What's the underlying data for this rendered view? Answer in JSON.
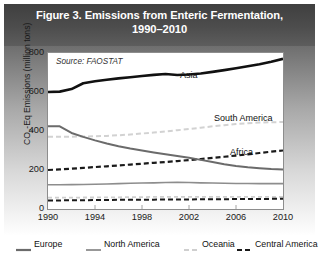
{
  "figure": {
    "title_line1": "Figure 3. Emissions from Enteric Fermentation,",
    "title_line2": "1990–2010",
    "source_note": "Source: FAOSTAT"
  },
  "axis": {
    "y_title_prefix": "CO",
    "y_title_sub": "2",
    "y_title_suffix": "-Eq Emissions (million tons)",
    "y_ticks": [
      "800",
      "600",
      "400",
      "200",
      "0"
    ],
    "x_ticks": [
      "1990",
      "1994",
      "1998",
      "2002",
      "2006",
      "2010"
    ]
  },
  "series_labels": {
    "asia": "Asia",
    "south_america": "South America",
    "africa": "Africa"
  },
  "legend": {
    "items": [
      {
        "label": "Europe",
        "color": "#6b6b6b",
        "style": "solid",
        "width": 2.2
      },
      {
        "label": "North America",
        "color": "#8d8d8d",
        "style": "solid",
        "width": 1.8
      },
      {
        "label": "Oceania",
        "color": "#cfcfcf",
        "style": "dashed",
        "width": 1.8
      },
      {
        "label": "Central America",
        "color": "#1a1a1a",
        "style": "dashed",
        "width": 2.0
      }
    ]
  },
  "colors": {
    "header_band": "#4d4d4d",
    "plot_border": "#8d8d8d",
    "asia": "#111111",
    "south_america": "#d2d2d2",
    "africa": "#1a1a1a",
    "europe": "#6b6b6b",
    "north_america": "#8d8d8d",
    "oceania": "#cfcfcf",
    "central_america": "#1a1a1a"
  },
  "chart_data": {
    "type": "line",
    "title": "Figure 3. Emissions from Enteric Fermentation, 1990–2010",
    "xlabel": "",
    "ylabel": "CO2-Eq Emissions (million tons)",
    "xlim": [
      1990,
      2010
    ],
    "ylim": [
      0,
      800
    ],
    "y_ticks": [
      0,
      200,
      400,
      600,
      800
    ],
    "x_ticks": [
      1990,
      1994,
      1998,
      2002,
      2006,
      2010
    ],
    "grid": false,
    "legend_position": "below-plot",
    "source": "FAOSTAT",
    "x": [
      1990,
      1991,
      1992,
      1993,
      1994,
      1995,
      1996,
      1997,
      1998,
      1999,
      2000,
      2001,
      2002,
      2003,
      2004,
      2005,
      2006,
      2007,
      2008,
      2009,
      2010
    ],
    "series": [
      {
        "name": "Asia",
        "color": "#111111",
        "style": "solid",
        "labeled_on_plot": true,
        "values": [
          600,
          602,
          615,
          645,
          655,
          663,
          670,
          676,
          682,
          688,
          692,
          687,
          690,
          695,
          703,
          712,
          722,
          732,
          742,
          755,
          770
        ]
      },
      {
        "name": "South America",
        "color": "#d2d2d2",
        "style": "dashed",
        "labeled_on_plot": true,
        "values": [
          370,
          370,
          371,
          372,
          373,
          375,
          378,
          382,
          387,
          392,
          398,
          404,
          410,
          417,
          424,
          430,
          436,
          440,
          443,
          445,
          446
        ]
      },
      {
        "name": "Africa",
        "color": "#1a1a1a",
        "style": "dashed",
        "labeled_on_plot": true,
        "values": [
          200,
          203,
          207,
          211,
          215,
          219,
          223,
          228,
          232,
          237,
          241,
          246,
          251,
          256,
          262,
          268,
          274,
          280,
          287,
          294,
          300
        ]
      },
      {
        "name": "Europe",
        "color": "#6b6b6b",
        "style": "solid",
        "labeled_on_plot": false,
        "values": [
          425,
          424,
          390,
          370,
          352,
          336,
          322,
          310,
          300,
          290,
          281,
          272,
          263,
          252,
          241,
          230,
          221,
          214,
          209,
          205,
          203
        ]
      },
      {
        "name": "North America",
        "color": "#8d8d8d",
        "style": "solid",
        "labeled_on_plot": false,
        "values": [
          124,
          124,
          125,
          126,
          127,
          128,
          130,
          132,
          133,
          134,
          136,
          137,
          136,
          134,
          133,
          132,
          131,
          131,
          130,
          130,
          130
        ]
      },
      {
        "name": "Oceania",
        "color": "#cfcfcf",
        "style": "dashed",
        "labeled_on_plot": false,
        "values": [
          58,
          58,
          58,
          59,
          59,
          60,
          60,
          61,
          61,
          62,
          62,
          62,
          62,
          62,
          62,
          62,
          62,
          62,
          62,
          62,
          62
        ]
      },
      {
        "name": "Central America",
        "color": "#1a1a1a",
        "style": "dashed",
        "labeled_on_plot": false,
        "values": [
          44,
          44,
          45,
          45,
          46,
          46,
          47,
          47,
          48,
          48,
          49,
          49,
          49,
          50,
          50,
          50,
          51,
          51,
          51,
          52,
          52
        ]
      }
    ]
  }
}
